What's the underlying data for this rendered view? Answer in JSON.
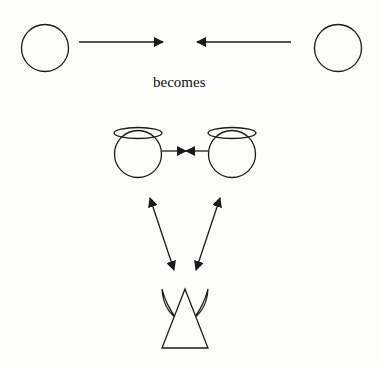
{
  "diagram": {
    "caption": "becomes",
    "stroke_color": "#1a1a1a",
    "background": "#fdfdfb",
    "top_row": {
      "left_node": "plain circle",
      "right_node": "plain circle",
      "arrows": "two arrows pointing toward center from each side"
    },
    "middle_row": {
      "left_node": "circle with halo (angel)",
      "right_node": "circle with halo (angel)",
      "connection": "arrows pointing toward each other meeting in the middle"
    },
    "bottom_node": "triangle with horns (devil)",
    "links": [
      {
        "from": "left-angel",
        "to": "devil",
        "type": "double-headed arrow"
      },
      {
        "from": "right-angel",
        "to": "devil",
        "type": "double-headed arrow"
      }
    ]
  }
}
